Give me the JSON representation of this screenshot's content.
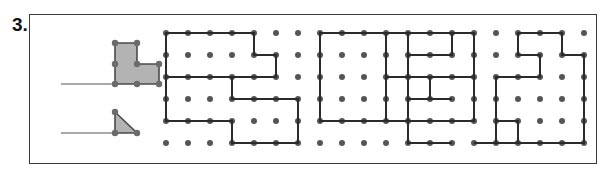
{
  "worksheet": {
    "problem_number": "3.",
    "panel": {
      "border_color": "#3a3a3a",
      "background": "#ffffff",
      "x": 29,
      "y": 14,
      "width": 568,
      "height": 150
    }
  },
  "style": {
    "dot_color": "#555555",
    "dot_radius": 3.0,
    "path_color": "#2b2b2b",
    "path_width": 2.0,
    "shape_fill": "#b3b3b3",
    "shape_stroke": "#4a4a4a",
    "vertex_color": "#6b6b6b",
    "vertex_radius": 3.2,
    "answer_line_color": "#555555",
    "answer_line_width": 1.2
  },
  "grid": {
    "origin_x": 166,
    "origin_y": 33,
    "spacing": 22,
    "columns": 20,
    "rows": 6
  },
  "answer_lines": [
    {
      "name": "answer-line-lshape",
      "x1": 61,
      "y1": 84,
      "x2": 113,
      "y2": 84
    },
    {
      "name": "answer-line-triangle",
      "x1": 61,
      "y1": 133,
      "x2": 113,
      "y2": 133
    }
  ],
  "key_shapes": [
    {
      "name": "l-shape-key",
      "label": "L-shape unit figure",
      "points": "115,43 137,43 137,64 159,64 159,84 115,84",
      "vertices": [
        [
          115,
          43
        ],
        [
          137,
          43
        ],
        [
          137,
          64
        ],
        [
          159,
          64
        ],
        [
          159,
          84
        ],
        [
          115,
          84
        ],
        [
          137,
          84
        ],
        [
          115,
          64
        ]
      ]
    },
    {
      "name": "triangle-key",
      "label": "Right triangle unit figure",
      "points": "115,112 115,133 137,133",
      "vertices": [
        [
          115,
          112
        ],
        [
          115,
          133
        ],
        [
          137,
          133
        ]
      ]
    }
  ],
  "figures": [
    {
      "name": "figure-1",
      "description": "Rectangle with notch on right side, rows 0-2, cols 0-4",
      "points": "0,0 4,0 4,1 5,1 5,2 0,2 0,0",
      "closed": true
    },
    {
      "name": "figure-2",
      "description": "Stepped L polygon, rows 2-5, cols 0-5",
      "points": "0,2 3,2 3,3 6,3 6,5 3,5 3,4 0,4 0,2",
      "closed": true
    },
    {
      "name": "figure-3",
      "description": "Tall rectangle, rows 0-4, cols 7-10",
      "points": "7,0 10,0 10,4 7,4 7,0",
      "closed": true
    },
    {
      "name": "figure-4",
      "description": "Small notch shape upper, rows 0-2, cols 11-13",
      "points": "13,0 11,0 11,2 13,2",
      "closed": false
    },
    {
      "name": "figure-5",
      "description": "Small notch shape lower, rows 3-5, cols 11-13",
      "points": "13,3 11,3 11,5 13,5",
      "closed": false
    },
    {
      "name": "figure-6",
      "description": "Zigzag staircase polygon, rows 0-4, cols 10-13",
      "points": "10,0 11,0 11,1 13,1 13,0 14,0 14,2 12,2 12,3 11,3 11,2 10,2 10,0",
      "closed": true
    },
    {
      "name": "figure-7",
      "description": "Long baseline bar, rows 2-4, cols 10-14",
      "points": "10,2 14,2 14,4 10,4",
      "closed": false
    },
    {
      "name": "figure-8",
      "description": "Right side hook shape, rows 2-5, cols 14-16",
      "points": "16,2 15,2 15,4 16,4 16,5 14,5",
      "closed": false
    },
    {
      "name": "figure-9",
      "description": "Spiral polygon right group, rows 0-5, cols 15-19",
      "points": "16,0 18,0 18,1 19,1 19,5 15,5 15,2 17,2 17,1 16,1 16,0",
      "closed": true
    }
  ]
}
